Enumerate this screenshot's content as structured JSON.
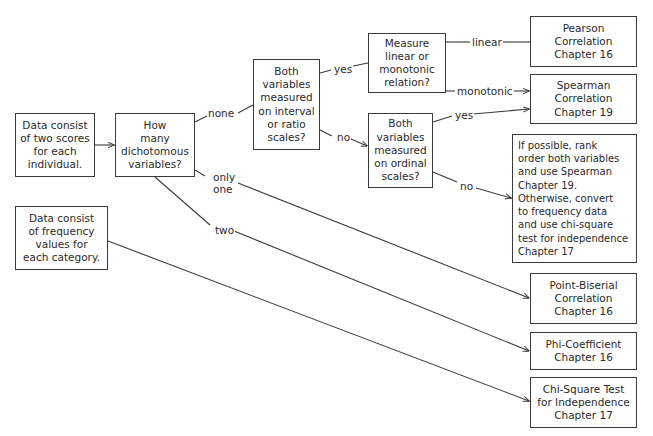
{
  "diagram": {
    "nodes": {
      "two_scores": "Data consist\nof two scores\nfor each\nindividual.",
      "how_many": "How\nmany\ndichotomous\nvariables?",
      "interval_ratio": "Both\nvariables\nmeasured\non interval\nor ratio\nscales?",
      "linear_monotonic": "Measure\nlinear or\nmonotonic\nrelation?",
      "ordinal": "Both\nvariables\nmeasured\non ordinal\nscales?",
      "pearson": "Pearson\nCorrelation\nChapter 16",
      "spearman": "Spearman\nCorrelation\nChapter 19",
      "if_possible": "If possible, rank\norder both variables\nand use Spearman\nChapter 19.\nOtherwise, convert\nto frequency data\nand use chi-square\ntest for independence\nChapter 17",
      "frequency": "Data consist\nof frequency\nvalues for\neach category.",
      "point_biserial": "Point-Biserial\nCorrelation\nChapter 16",
      "phi": "Phi-Coefficient\nChapter 16",
      "chi_square": "Chi-Square Test\nfor Independence\nChapter 17"
    },
    "edge_labels": {
      "none": "none",
      "only_one": "only\none",
      "two": "two",
      "yes_interval": "yes",
      "no_interval": "no",
      "linear": "linear",
      "monotonic": "monotonic",
      "yes_ordinal": "yes",
      "no_ordinal": "no"
    }
  }
}
